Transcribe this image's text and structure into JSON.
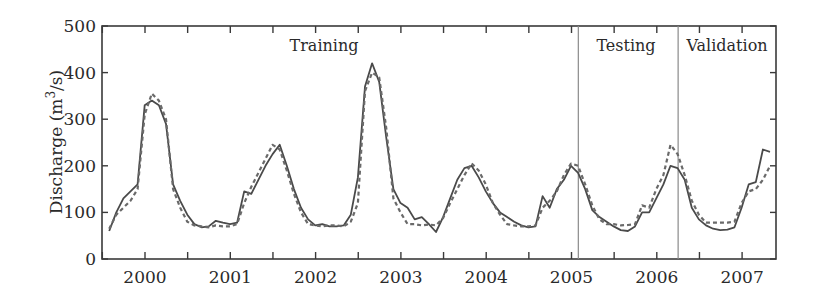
{
  "chart_data": {
    "type": "line",
    "title": "",
    "xlabel": "",
    "ylabel": "Discharge (m³/s)",
    "ylabel_parts": {
      "main": "Discharge (m",
      "sup": "3",
      "tail": "/s)"
    },
    "ylim": [
      0,
      500
    ],
    "yticks": [
      0,
      100,
      200,
      300,
      400,
      500
    ],
    "xticks": [
      "2000",
      "2001",
      "2002",
      "2003",
      "2004",
      "2005",
      "2006",
      "2007"
    ],
    "x_start": 1999.58,
    "x_step": 0.0833,
    "grid": false,
    "legend": null,
    "regions": [
      {
        "label": "Training",
        "from": 1999.58,
        "to": 2005.08
      },
      {
        "label": "Testing",
        "from": 2005.08,
        "to": 2006.25
      },
      {
        "label": "Validation",
        "from": 2006.25,
        "to": 2007.4
      }
    ],
    "dividers": [
      2005.08,
      2006.25
    ],
    "series": [
      {
        "name": "Observed",
        "style": "solid",
        "values": [
          60,
          100,
          130,
          145,
          160,
          330,
          340,
          330,
          290,
          160,
          125,
          95,
          75,
          68,
          70,
          82,
          78,
          75,
          78,
          145,
          140,
          170,
          200,
          225,
          245,
          200,
          150,
          110,
          85,
          72,
          75,
          70,
          70,
          72,
          95,
          175,
          370,
          420,
          380,
          260,
          150,
          120,
          110,
          85,
          90,
          75,
          58,
          90,
          130,
          170,
          195,
          200,
          175,
          145,
          120,
          100,
          90,
          80,
          72,
          68,
          70,
          135,
          110,
          150,
          170,
          200,
          185,
          150,
          105,
          90,
          80,
          70,
          62,
          60,
          70,
          100,
          100,
          130,
          160,
          200,
          195,
          170,
          110,
          85,
          72,
          65,
          62,
          63,
          68,
          110,
          160,
          165,
          235,
          230,
          180,
          120,
          82,
          75,
          75,
          70,
          66,
          60,
          62,
          75,
          70,
          80,
          190,
          330,
          220,
          140,
          95,
          90,
          75
        ]
      },
      {
        "name": "Predicted",
        "style": "dashed",
        "values": [
          65,
          95,
          110,
          125,
          150,
          310,
          355,
          340,
          300,
          150,
          110,
          80,
          72,
          70,
          68,
          72,
          70,
          70,
          75,
          120,
          155,
          185,
          215,
          245,
          235,
          190,
          140,
          100,
          75,
          72,
          70,
          72,
          72,
          70,
          80,
          120,
          360,
          400,
          390,
          280,
          130,
          100,
          75,
          75,
          72,
          74,
          72,
          88,
          120,
          150,
          180,
          205,
          190,
          160,
          120,
          95,
          75,
          72,
          70,
          70,
          72,
          110,
          125,
          145,
          180,
          205,
          200,
          160,
          115,
          85,
          75,
          75,
          72,
          73,
          75,
          115,
          110,
          150,
          180,
          245,
          225,
          180,
          125,
          95,
          78,
          78,
          78,
          78,
          80,
          120,
          145,
          150,
          170,
          200,
          195,
          160,
          100,
          80,
          80,
          78,
          80,
          80,
          110,
          115,
          130,
          160,
          250,
          300,
          230,
          150,
          100,
          85,
          80
        ]
      }
    ]
  },
  "colors": {
    "axis": "#3a3a3a",
    "observed": "#4a4a4a",
    "predicted": "#6a6a6a",
    "divider": "#8a8a8a",
    "text": "#2a2a2a"
  }
}
